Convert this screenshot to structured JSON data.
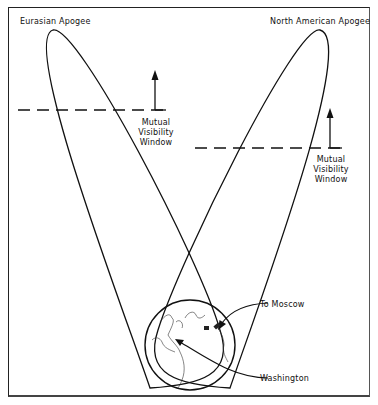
{
  "labels": {
    "eurasian_apogee": "Eurasian Apogee",
    "north_american_apogee": "North American Apogee",
    "window_left": [
      "Mutual",
      "Visibility",
      "Window"
    ],
    "window_right": [
      "Mutual",
      "Visibility",
      "Window"
    ],
    "to_moscow": "To Moscow",
    "washington": "Washington"
  },
  "colors": {
    "line": "#111111",
    "background": "#ffffff"
  }
}
